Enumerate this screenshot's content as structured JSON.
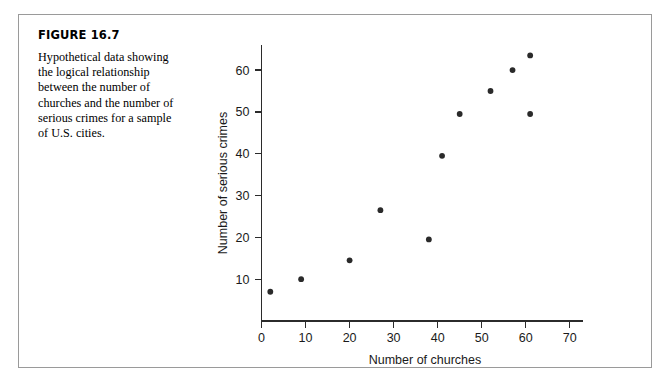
{
  "figure": {
    "label": "FIGURE 16.7",
    "caption": "Hypothetical data showing\nthe logical relationship\nbetween the number of\nchurches and the number of\nserious crimes for a sample\nof U.S. cities."
  },
  "chart_data": {
    "type": "scatter",
    "title": "",
    "xlabel": "Number of churches",
    "ylabel": "Number of serious crimes",
    "xlim": [
      0,
      73
    ],
    "ylim": [
      0,
      66
    ],
    "xticks": [
      0,
      10,
      20,
      30,
      40,
      50,
      60,
      70
    ],
    "yticks": [
      10,
      20,
      30,
      40,
      50,
      60
    ],
    "grid": false,
    "legend": "none",
    "marker_color": "#2a2a2a",
    "points": [
      {
        "x": 2,
        "y": 7
      },
      {
        "x": 9,
        "y": 10
      },
      {
        "x": 20,
        "y": 14.5
      },
      {
        "x": 27,
        "y": 26.5
      },
      {
        "x": 38,
        "y": 19.5
      },
      {
        "x": 41,
        "y": 39.5
      },
      {
        "x": 45,
        "y": 49.5
      },
      {
        "x": 52,
        "y": 55
      },
      {
        "x": 57,
        "y": 60
      },
      {
        "x": 61,
        "y": 49.5
      },
      {
        "x": 61,
        "y": 63.5
      }
    ]
  }
}
